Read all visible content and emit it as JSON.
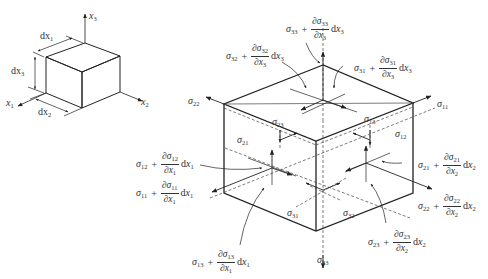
{
  "small_cube": {
    "axes": {
      "x1": "x",
      "x1_sub": "1",
      "x2": "x",
      "x2_sub": "2",
      "x3": "x",
      "x3_sub": "3"
    },
    "dims": [
      {
        "label": "dx",
        "sub": "1"
      },
      {
        "label": "dx",
        "sub": "3"
      },
      {
        "label": "dx",
        "sub": "2"
      }
    ]
  },
  "face_stresses": {
    "s22": {
      "sym": "σ",
      "sub": "22"
    },
    "s11": {
      "sym": "σ",
      "sub": "11"
    },
    "s23": {
      "sym": "σ",
      "sub": "23"
    },
    "s13": {
      "sym": "σ",
      "sub": "13"
    },
    "s12": {
      "sym": "σ",
      "sub": "12"
    },
    "s21": {
      "sym": "σ",
      "sub": "21"
    },
    "s31": {
      "sym": "σ",
      "sub": "31"
    },
    "s32": {
      "sym": "σ",
      "sub": "32"
    },
    "s33": {
      "sym": "σ",
      "sub": "33"
    }
  },
  "increment_expressions": [
    {
      "id": "e33",
      "sig_sub": "33",
      "num_sub": "33",
      "den_sub": "3",
      "dx_sub": "3"
    },
    {
      "id": "e32",
      "sig_sub": "32",
      "num_sub": "32",
      "den_sub": "3",
      "dx_sub": "3"
    },
    {
      "id": "e31",
      "sig_sub": "31",
      "num_sub": "31",
      "den_sub": "3",
      "dx_sub": "3"
    },
    {
      "id": "e12",
      "sig_sub": "12",
      "num_sub": "12",
      "den_sub": "1",
      "dx_sub": "1"
    },
    {
      "id": "e11",
      "sig_sub": "11",
      "num_sub": "11",
      "den_sub": "1",
      "dx_sub": "1"
    },
    {
      "id": "e21",
      "sig_sub": "21",
      "num_sub": "21",
      "den_sub": "2",
      "dx_sub": "2"
    },
    {
      "id": "e22",
      "sig_sub": "22",
      "num_sub": "22",
      "den_sub": "2",
      "dx_sub": "2"
    },
    {
      "id": "e23",
      "sig_sub": "23",
      "num_sub": "23",
      "den_sub": "2",
      "dx_sub": "2"
    },
    {
      "id": "e13",
      "sig_sub": "13",
      "num_sub": "13",
      "den_sub": "1",
      "dx_sub": "1"
    }
  ],
  "symbols": {
    "sigma": "σ",
    "partial": "∂",
    "plus": "+",
    "d": "d",
    "x": "x"
  }
}
